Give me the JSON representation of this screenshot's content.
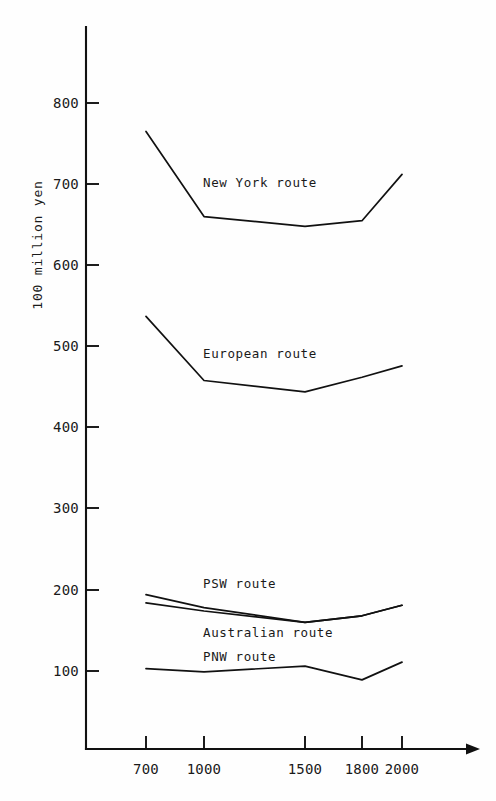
{
  "chart_data": {
    "type": "line",
    "title": "",
    "subtitle": "",
    "xlabel": "",
    "ylabel": "100 million yen",
    "x": [
      700,
      1000,
      1500,
      1800,
      2000
    ],
    "xtick_labels": [
      "700",
      "1000",
      "1500",
      "1800",
      "2000"
    ],
    "ytick_labels": [
      "100",
      "200",
      "300",
      "400",
      "500",
      "600",
      "700",
      "800"
    ],
    "yticks": [
      100,
      200,
      300,
      400,
      500,
      600,
      700,
      800
    ],
    "xlim": [
      600,
      2180
    ],
    "ylim": [
      0,
      860
    ],
    "grid": false,
    "legend": "inline-annotations",
    "series": [
      {
        "name": "New York route",
        "label": "New York  route",
        "values": [
          765,
          660,
          648,
          655,
          712
        ]
      },
      {
        "name": "European route",
        "label": "European  route",
        "values": [
          537,
          458,
          444,
          462,
          476
        ]
      },
      {
        "name": "PSW route",
        "label": "PSW  route",
        "values": [
          194,
          178,
          160,
          168,
          181
        ]
      },
      {
        "name": "Australian route",
        "label": "Australian  route",
        "values": [
          184,
          174,
          160,
          168,
          181
        ]
      },
      {
        "name": "PNW route",
        "label": "PNW  route",
        "values": [
          103,
          99,
          106,
          89,
          111
        ]
      }
    ]
  },
  "axis": {
    "y_title": "100 million yen",
    "x_arrow": "arrow-right-icon"
  },
  "ytick": {
    "t800": "800",
    "t700": "700",
    "t600": "600",
    "t500": "500",
    "t400": "400",
    "t300": "300",
    "t200": "200",
    "t100": "100"
  },
  "xtick": {
    "t700": "700",
    "t1000": "1000",
    "t1500": "1500",
    "t1800": "1800",
    "t2000": "2000"
  },
  "labels": {
    "new_york": "New York  route",
    "european": "European  route",
    "psw": "PSW  route",
    "australian": "Australian  route",
    "pnw": "PNW  route"
  }
}
